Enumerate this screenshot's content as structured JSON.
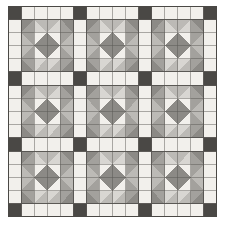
{
  "image": {
    "title": "Patchwork quilt pattern",
    "kind": "quilt-diagram",
    "width": 225,
    "height": 232
  },
  "canvas": {
    "background": "#ffffff",
    "quilt_left": 8,
    "quilt_top": 6,
    "quilt_width": 209,
    "quilt_height": 211
  },
  "palette": {
    "light": "#f2f0ec",
    "mid_light": "#d8d6d2",
    "mid": "#bcbab6",
    "mid_dark": "#a3a19d",
    "dark": "#8c8a86",
    "accent_dark": "#4a4845",
    "line": "#555350",
    "border": "#4a4845",
    "background": "#ffffff"
  },
  "layout": {
    "blocks_across": 3,
    "blocks_down": 3,
    "block_units": 4,
    "sash_width_units": 1,
    "sash_label": "sashing",
    "cornerstone_label": "cornerstone",
    "block_label": "star-block",
    "hst_label": "half-square-triangle"
  },
  "legend": {
    "entries": [
      {
        "name": "light",
        "color": "#f2f0ec",
        "label": "Light"
      },
      {
        "name": "mid-light",
        "color": "#d8d6d2",
        "label": "Mid light"
      },
      {
        "name": "mid",
        "color": "#bcbab6",
        "label": "Mid"
      },
      {
        "name": "mid-dark",
        "color": "#a3a19d",
        "label": "Mid dark"
      },
      {
        "name": "dark",
        "color": "#8c8a86",
        "label": "Dark"
      },
      {
        "name": "accent-dark",
        "color": "#4a4845",
        "label": "Accent dark"
      }
    ]
  },
  "chart_data": {
    "type": "heatmap",
    "title": "Patchwork quilt pattern",
    "grid_cols": 17,
    "grid_rows": 17,
    "cell_px": 12.3,
    "legend": [
      "light",
      "mid-light",
      "mid",
      "mid-dark",
      "dark",
      "accent-dark"
    ],
    "block_pattern": [
      [
        "hst-tl-dark",
        "hst-tr-dark",
        "hst-tl-mid",
        "hst-tr-mid"
      ],
      [
        "hst-bl-dark",
        "hst-br-dark",
        "hst-bl-mid",
        "hst-br-mid"
      ],
      [
        "hst-tl-mid",
        "hst-tr-mid",
        "hst-tl-dark",
        "hst-tr-dark"
      ],
      [
        "hst-bl-mid",
        "hst-br-mid",
        "hst-bl-dark",
        "hst-br-dark"
      ]
    ],
    "sash_color": "light",
    "cornerstone_color": "accent-dark"
  }
}
